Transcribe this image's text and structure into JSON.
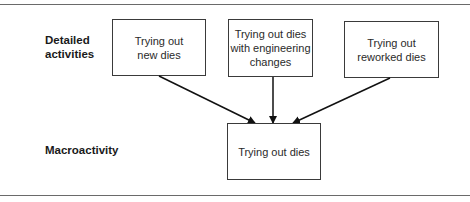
{
  "diagram": {
    "row_labels": {
      "detailed": "Detailed\nactivities",
      "macro": "Macroactivity"
    },
    "detailed_activities": [
      {
        "label": "Trying out\nnew dies"
      },
      {
        "label": "Trying out dies\nwith engineering\nchanges"
      },
      {
        "label": "Trying out\nreworked dies"
      }
    ],
    "macroactivity": {
      "label": "Trying out dies"
    },
    "edges": [
      {
        "from": "Trying out new dies",
        "to": "Trying out dies"
      },
      {
        "from": "Trying out dies with engineering changes",
        "to": "Trying out dies"
      },
      {
        "from": "Trying out reworked dies",
        "to": "Trying out dies"
      }
    ]
  }
}
